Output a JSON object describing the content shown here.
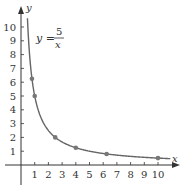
{
  "chart_data": {
    "type": "scatter",
    "title": "",
    "equation_label": {
      "lhs": "y =",
      "numerator": "5",
      "denominator": "x"
    },
    "xlabel": "x",
    "ylabel": "y",
    "xlim": [
      0,
      11
    ],
    "ylim": [
      0,
      11
    ],
    "x_ticks": [
      1,
      2,
      3,
      4,
      5,
      6,
      7,
      8,
      9,
      10
    ],
    "y_ticks": [
      1,
      2,
      3,
      4,
      5,
      6,
      7,
      8,
      9,
      10
    ],
    "grid": false,
    "curve": {
      "function": "y = 5/x",
      "x_range": [
        0.47,
        10.9
      ],
      "color": "#666666"
    },
    "points": [
      {
        "x": 0.8,
        "y": 6.25
      },
      {
        "x": 1,
        "y": 5
      },
      {
        "x": 2.5,
        "y": 2
      },
      {
        "x": 4,
        "y": 1.25
      },
      {
        "x": 6.25,
        "y": 0.8
      },
      {
        "x": 10,
        "y": 0.5
      }
    ],
    "colors": {
      "axis": "#333333",
      "curve": "#666666",
      "point": "#777777"
    }
  }
}
